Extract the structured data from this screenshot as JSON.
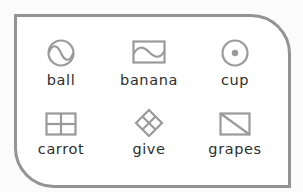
{
  "panel": {
    "border_color": "#939393",
    "icon_color": "#9a9a9a",
    "items": [
      {
        "label": "ball",
        "icon": "circle-wave-icon"
      },
      {
        "label": "banana",
        "icon": "rect-wave-icon"
      },
      {
        "label": "cup",
        "icon": "circle-dot-icon"
      },
      {
        "label": "carrot",
        "icon": "grid-rect-icon"
      },
      {
        "label": "give",
        "icon": "diamond-grid-icon"
      },
      {
        "label": "grapes",
        "icon": "rect-diagonal-icon"
      }
    ]
  }
}
